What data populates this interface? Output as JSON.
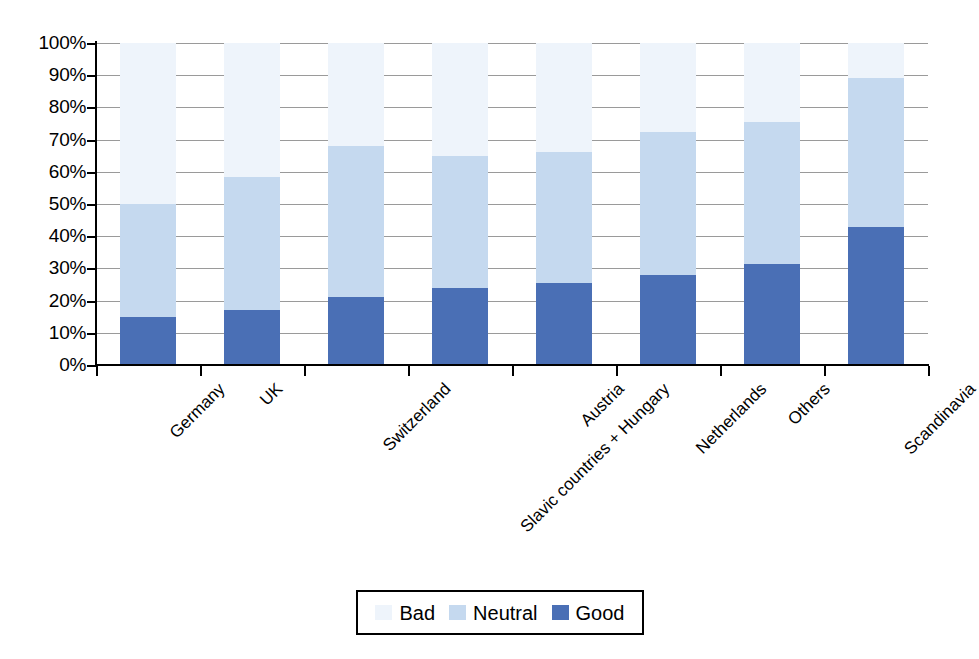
{
  "chart_data": {
    "type": "bar",
    "subtype": "stacked-percent",
    "title": "",
    "xlabel": "",
    "ylabel": "",
    "ylim": [
      0,
      100
    ],
    "ytick_labels": [
      "100%",
      "90%",
      "80%",
      "70%",
      "60%",
      "50%",
      "40%",
      "30%",
      "20%",
      "10%",
      "0%"
    ],
    "ytick_values": [
      100,
      90,
      80,
      70,
      60,
      50,
      40,
      30,
      20,
      10,
      0
    ],
    "grid": true,
    "legend_position": "bottom",
    "categories": [
      "Germany",
      "UK",
      "Switzerland",
      "Slavic countries + Hungary",
      "Austria",
      "Netherlands",
      "Others",
      "Scandinavia"
    ],
    "series": [
      {
        "name": "Good",
        "color": "#4a6fb5",
        "values": [
          15,
          17,
          21,
          24,
          25.5,
          28,
          31.5,
          43
        ]
      },
      {
        "name": "Neutral",
        "color": "#c5d9ef",
        "values": [
          35,
          41.5,
          47,
          41,
          40.5,
          44.5,
          44,
          46
        ]
      },
      {
        "name": "Bad",
        "color": "#eef4fb",
        "values": [
          50,
          41.5,
          32,
          35,
          34,
          27.5,
          24.5,
          11
        ]
      }
    ],
    "stack_tops_good": [
      15,
      17,
      21,
      24,
      25.5,
      28,
      31.5,
      43
    ],
    "stack_tops_neutral": [
      50,
      58.5,
      68,
      65,
      66,
      72.5,
      75.5,
      89
    ]
  },
  "legend": {
    "entries": [
      {
        "label": "Bad",
        "color": "#eef4fb"
      },
      {
        "label": "Neutral",
        "color": "#c5d9ef"
      },
      {
        "label": "Good",
        "color": "#4a6fb5"
      }
    ]
  },
  "colors": {
    "good": "#4a6fb5",
    "neutral": "#c5d9ef",
    "bad": "#eef4fb",
    "gridline": "#9a9a9a",
    "axis": "#000000",
    "background": "#ffffff"
  }
}
